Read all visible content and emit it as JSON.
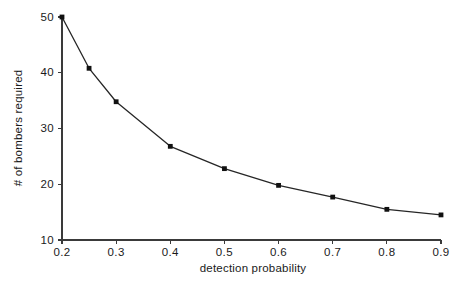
{
  "chart_data": {
    "type": "line",
    "title": "",
    "subtitle": "",
    "xlabel": "detection probability",
    "ylabel": "# of bombers required",
    "x": [
      0.2,
      0.25,
      0.3,
      0.4,
      0.5,
      0.6,
      0.7,
      0.8,
      0.9
    ],
    "values": [
      50.0,
      40.8,
      34.8,
      26.8,
      22.8,
      19.8,
      17.7,
      15.5,
      14.5
    ],
    "series": [
      {
        "name": "bombers required",
        "x": [
          0.2,
          0.25,
          0.3,
          0.4,
          0.5,
          0.6,
          0.7,
          0.8,
          0.9
        ],
        "values": [
          50.0,
          40.8,
          34.8,
          26.8,
          22.8,
          19.8,
          17.7,
          15.5,
          14.5
        ]
      }
    ],
    "xlim": [
      0.2,
      0.9
    ],
    "ylim": [
      10,
      50
    ],
    "xticks": [
      0.2,
      0.3,
      0.4,
      0.5,
      0.6,
      0.7,
      0.8,
      0.9
    ],
    "xtick_labels": [
      "0.2",
      "0.3",
      "0.4",
      "0.5",
      "0.6",
      "0.7",
      "0.8",
      "0.9"
    ],
    "yticks": [
      10,
      20,
      30,
      40,
      50
    ],
    "ytick_labels": [
      "10",
      "20",
      "30",
      "40",
      "50"
    ],
    "grid": false,
    "legend": false,
    "legend_position": "none",
    "marker": "square",
    "line_color": "#262626",
    "marker_color": "#111111",
    "axis_color": "#3a3a3a",
    "background_color": "#ffffff"
  }
}
